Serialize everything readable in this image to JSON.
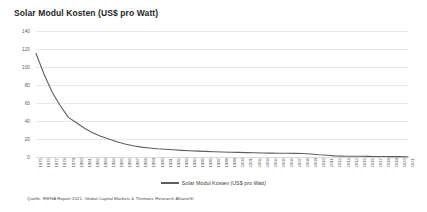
{
  "chart_title": "Solar Modul Kosten (US$ pro Watt)",
  "legend": {
    "label": "Solar Modul Kosten (US$ pro Watt)",
    "swatch_color": "#5e5e5e",
    "position": "bottom-center"
  },
  "source_note": "Quelle: IRENA Report 2021, Global Capital Markets & Thematic Research AllianzGI",
  "colors": {
    "line": "#5e5e5e",
    "grid": "#e8e8e8",
    "text": "#5a5a5a",
    "title": "#262626",
    "background": "#ffffff"
  },
  "chart_data": {
    "type": "line",
    "title": "Solar Modul Kosten (US$ pro Watt)",
    "xlabel": "",
    "ylabel": "",
    "ylim": [
      0,
      140
    ],
    "yticks": [
      0,
      20,
      40,
      60,
      80,
      100,
      120,
      140
    ],
    "grid": true,
    "legend_position": "bottom-center",
    "categories": [
      "1975",
      "1976",
      "1977",
      "1978",
      "1979",
      "1980",
      "1981",
      "1982",
      "1983",
      "1984",
      "1985",
      "1986",
      "1987",
      "1988",
      "1989",
      "1990",
      "1991",
      "1992",
      "1993",
      "1994",
      "1995",
      "1996",
      "1997",
      "1998",
      "1999",
      "2000",
      "2001",
      "2002",
      "2003",
      "2004",
      "2005",
      "2006",
      "2007",
      "2008",
      "2009",
      "2010",
      "2011",
      "2012",
      "2013",
      "2014",
      "2015",
      "2016",
      "2017",
      "2018",
      "2019",
      "2020",
      "2021"
    ],
    "series": [
      {
        "name": "Solar Modul Kosten (US$ pro Watt)",
        "color": "#5e5e5e",
        "values": [
          115.0,
          92.0,
          72.0,
          57.0,
          44.0,
          38.0,
          32.0,
          27.0,
          23.0,
          20.0,
          17.0,
          14.5,
          12.5,
          11.0,
          10.0,
          9.2,
          8.6,
          8.0,
          7.4,
          6.9,
          6.5,
          6.2,
          5.9,
          5.6,
          5.3,
          5.1,
          4.9,
          4.7,
          4.5,
          4.3,
          4.2,
          4.1,
          4.0,
          3.9,
          3.3,
          2.5,
          1.9,
          1.3,
          1.0,
          0.9,
          0.8,
          0.7,
          0.6,
          0.5,
          0.45,
          0.4,
          0.35
        ]
      }
    ]
  }
}
